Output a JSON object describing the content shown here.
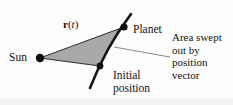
{
  "figure": {
    "background_color": "#fdfdfd",
    "ink_color": "#111111",
    "shaded_region_color": "#a9a9a9",
    "orbit_color": "#141414",
    "labels": {
      "sun": "Sun",
      "planet": "Planet",
      "vector_symbol_bold": "r",
      "vector_symbol_open_paren": "(",
      "vector_symbol_italic": "t",
      "vector_symbol_close_paren": ")",
      "initial_line1": "Initial",
      "initial_line2": "position",
      "area_line1": "Area swept",
      "area_line2": "out by",
      "area_line3": "position",
      "area_line4": "vector"
    },
    "points": {
      "sun": {
        "x": 40,
        "y": 58,
        "radius": 4.2
      },
      "planet": {
        "x": 124,
        "y": 27,
        "radius": 3.6
      },
      "initial_position": {
        "x": 100,
        "y": 66,
        "radius": 3.4
      }
    },
    "orbit_curve": {
      "start": {
        "x": 90,
        "y": 88
      },
      "control": {
        "x": 106,
        "y": 47
      },
      "end": {
        "x": 131,
        "y": 14
      }
    },
    "swept_sector": {
      "vertex": {
        "x": 40,
        "y": 58
      },
      "arc_start": {
        "x": 100,
        "y": 66
      },
      "arc_end": {
        "x": 124,
        "y": 27
      },
      "arc_control": {
        "x": 107,
        "y": 46
      }
    },
    "leader_line": {
      "from": {
        "x": 114,
        "y": 47
      },
      "to": {
        "x": 170,
        "y": 57
      }
    }
  }
}
